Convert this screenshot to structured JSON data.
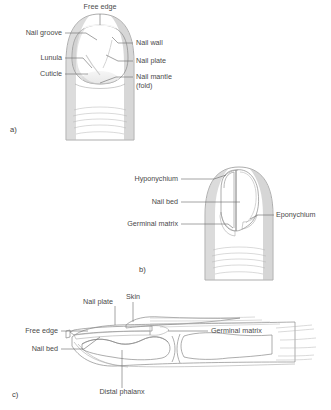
{
  "figure": {
    "background_color": "#ffffff",
    "label_color": "#4a4a4a",
    "leader_color": "#6b6b6b",
    "outline_color": "#8a8a8a",
    "skin_light": "#ededed",
    "skin_mid": "#dcdcdc",
    "skin_dark": "#c4c4c4",
    "nail_bed_dark": "#9a9a9a",
    "bone_fill": "#cfcfcf"
  },
  "panels": [
    {
      "letter": "a)",
      "view": "dorsal-surface-view",
      "labels": [
        {
          "id": "free-edge",
          "text": "Free edge",
          "x": 100,
          "y": 9,
          "anchor": "middle"
        },
        {
          "id": "nail-groove",
          "text": "Nail groove",
          "x": 62,
          "y": 35,
          "anchor": "end"
        },
        {
          "id": "lunula",
          "text": "Lunula",
          "x": 62,
          "y": 60,
          "anchor": "end"
        },
        {
          "id": "cuticle",
          "text": "Cuticle",
          "x": 62,
          "y": 76,
          "anchor": "end"
        },
        {
          "id": "nail-wall",
          "text": "Nail wall",
          "x": 136,
          "y": 45,
          "anchor": "start"
        },
        {
          "id": "nail-plate",
          "text": "Nail plate",
          "x": 136,
          "y": 63,
          "anchor": "start"
        },
        {
          "id": "nail-mantle",
          "text": "Nail mantle",
          "x": 136,
          "y": 79,
          "anchor": "start"
        },
        {
          "id": "nail-mantle2",
          "text": "(fold)",
          "x": 136,
          "y": 88,
          "anchor": "start"
        }
      ]
    },
    {
      "letter": "b)",
      "view": "nail-plate-lifted-view",
      "labels": [
        {
          "id": "hyponychium",
          "text": "Hyponychium",
          "x": 178,
          "y": 181,
          "anchor": "end"
        },
        {
          "id": "nail-bed",
          "text": "Nail bed",
          "x": 178,
          "y": 204,
          "anchor": "end"
        },
        {
          "id": "germinal-matrix",
          "text": "Germinal matrix",
          "x": 178,
          "y": 226,
          "anchor": "end"
        },
        {
          "id": "eponychium",
          "text": "Eponychium",
          "x": 276,
          "y": 217,
          "anchor": "start"
        }
      ]
    },
    {
      "letter": "c)",
      "view": "sagittal-section-view",
      "labels": [
        {
          "id": "nail-plate",
          "text": "Nail plate",
          "x": 113,
          "y": 304,
          "anchor": "end"
        },
        {
          "id": "skin",
          "text": "Skin",
          "x": 133,
          "y": 299,
          "anchor": "middle"
        },
        {
          "id": "free-edge",
          "text": "Free edge",
          "x": 58,
          "y": 333,
          "anchor": "end"
        },
        {
          "id": "nail-bed",
          "text": "Nail bed",
          "x": 58,
          "y": 351,
          "anchor": "end"
        },
        {
          "id": "germinal-matrix",
          "text": "Germinal matrix",
          "x": 211,
          "y": 333,
          "anchor": "start"
        },
        {
          "id": "distal-phalanx",
          "text": "Distal phalanx",
          "x": 122,
          "y": 394,
          "anchor": "middle"
        }
      ]
    }
  ]
}
